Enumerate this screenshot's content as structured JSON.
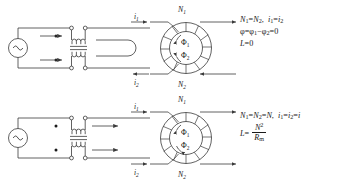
{
  "figure": {
    "line_color": "#3a3a3a",
    "text_color": "#1a1a1a",
    "background": "#ffffff"
  },
  "panels": [
    {
      "id": "top",
      "description": "Opposing currents cancel flux, zero inductance",
      "circuit": {
        "source_symbol": "~",
        "source_name": "ac-source",
        "winding_dots": 2,
        "lead_arrow_directions": [
          "right",
          "right"
        ],
        "right_loop": "u-turn"
      },
      "toroid": {
        "label_top": "N",
        "label_top_sub": "1",
        "label_bottom": "N",
        "label_bottom_sub": "2",
        "flux_upper": "Φ",
        "flux_upper_sub": "1",
        "flux_lower": "Φ",
        "flux_lower_sub": "2",
        "flux_sense_upper": "counterclockwise",
        "flux_sense_lower": "clockwise"
      },
      "currents": [
        {
          "name": "i",
          "sub": "1",
          "position": "upper-left",
          "arrow": "right"
        },
        {
          "name": "i",
          "sub": "2",
          "position": "lower-left",
          "arrow": "left"
        }
      ],
      "exit_arrows": [
        {
          "position": "upper-right",
          "arrow": "right"
        },
        {
          "position": "lower-right",
          "arrow": "left"
        }
      ],
      "equations": [
        "N₁ = N₂,  i₁ = i₂",
        "φ = φ₁ − φ₂ = 0",
        "L = 0"
      ]
    },
    {
      "id": "bottom",
      "description": "Aiding currents add flux, inductance N squared over reluctance",
      "circuit": {
        "source_symbol": "~",
        "source_name": "ac-source",
        "winding_dots": 2,
        "lead_arrow_directions": [
          "right",
          "right"
        ],
        "right_loop": "none"
      },
      "toroid": {
        "label_top": "N",
        "label_top_sub": "1",
        "label_bottom": "N",
        "label_bottom_sub": "2",
        "flux_upper": "Φ",
        "flux_upper_sub": "1",
        "flux_lower": "Φ",
        "flux_lower_sub": "2",
        "flux_sense_upper": "counterclockwise",
        "flux_sense_lower": "counterclockwise"
      },
      "currents": [
        {
          "name": "i",
          "sub": "1",
          "position": "upper-left",
          "arrow": "right"
        },
        {
          "name": "i",
          "sub": "2",
          "position": "lower-left",
          "arrow": "right"
        }
      ],
      "exit_arrows": [
        {
          "position": "upper-right",
          "arrow": "right"
        },
        {
          "position": "lower-right",
          "arrow": "right"
        }
      ],
      "equations": [
        "N₁ = N₂ = N,  i₁ = i₂ = i",
        "L = N² / Rₘ"
      ]
    }
  ],
  "symbols": {
    "N": "N",
    "i": "i",
    "L": "L",
    "R": "R",
    "phi_cap": "Φ",
    "phi_low": "φ",
    "equals": "=",
    "minus": "−",
    "zero": "0",
    "comma": ",",
    "sub1": "1",
    "sub2": "2",
    "subm": "m",
    "sup2": "2"
  }
}
